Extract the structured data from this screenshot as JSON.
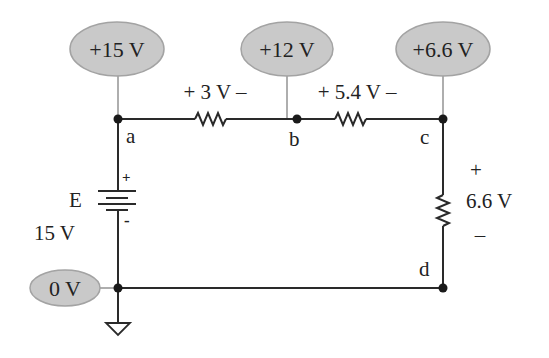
{
  "diagram": {
    "type": "circuit",
    "colors": {
      "wire": "#2a2a2a",
      "probe_fill": "#c9c9c9",
      "probe_stroke": "#a3a3a3",
      "lead": "#9a9a9a",
      "text": "#222222"
    },
    "probes": [
      {
        "id": "probe-a",
        "label": "+15 V",
        "node": "a"
      },
      {
        "id": "probe-b",
        "label": "+12 V",
        "node": "b"
      },
      {
        "id": "probe-c",
        "label": "+6.6 V",
        "node": "c"
      },
      {
        "id": "probe-ground",
        "label": "0 V",
        "node": "ground"
      }
    ],
    "nodes": [
      {
        "id": "a",
        "label": "a"
      },
      {
        "id": "b",
        "label": "b"
      },
      {
        "id": "c",
        "label": "c"
      },
      {
        "id": "d",
        "label": "d"
      }
    ],
    "resistors": [
      {
        "id": "R1",
        "between": "a-b",
        "drop_label": "+ 3 V –"
      },
      {
        "id": "R2",
        "between": "b-c",
        "drop_label": "+ 5.4 V –"
      },
      {
        "id": "R3",
        "between": "c-d",
        "plus": "+",
        "drop_label": "6.6 V",
        "minus": "–"
      }
    ],
    "source": {
      "name": "E",
      "value": "15 V",
      "plus": "+",
      "minus": "-"
    },
    "ground": {
      "symbol": "ground-icon"
    }
  }
}
